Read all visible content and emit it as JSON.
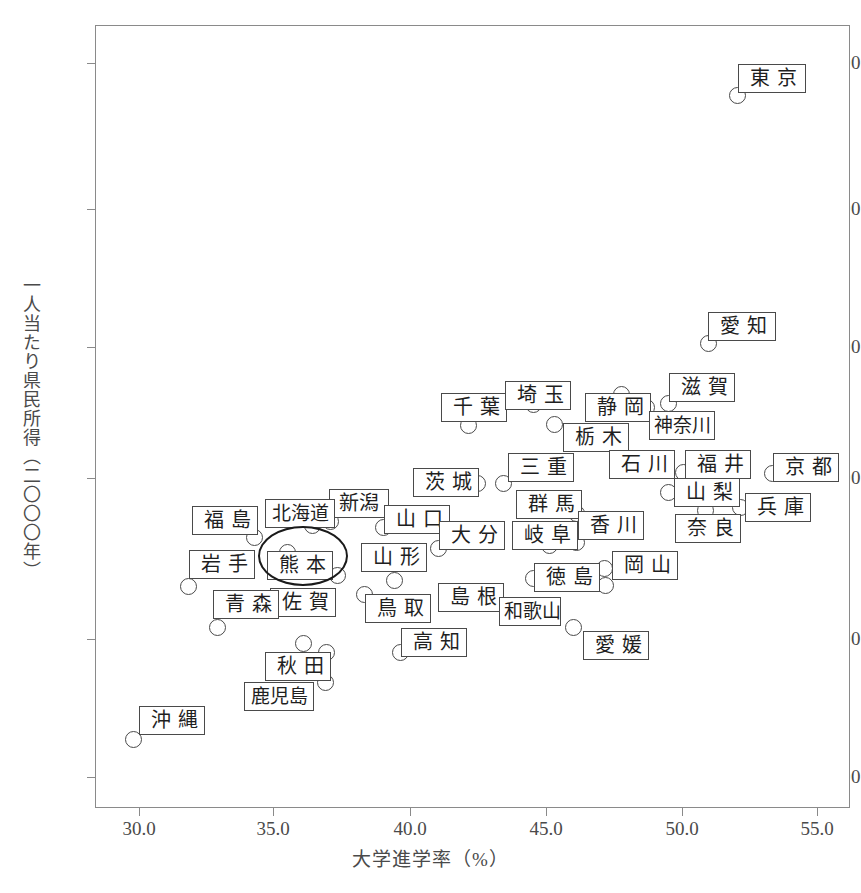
{
  "chart_data": {
    "type": "scatter",
    "title": "",
    "xlabel": "大学進学率（%）",
    "ylabel": "一人当たり県民所得（二〇〇〇年）",
    "xlim": [
      28.8,
      56.0
    ],
    "ylim": [
      1890,
      4610
    ],
    "xticks": [
      "30.0",
      "35.0",
      "40.0",
      "45.0",
      "50.0",
      "55.0"
    ],
    "xtick_values": [
      30.0,
      35.0,
      40.0,
      45.0,
      50.0,
      55.0
    ],
    "yticks": [
      "2000",
      "2500",
      "3000",
      "3500",
      "4000",
      "4500"
    ],
    "ytick_values": [
      2000,
      2500,
      3000,
      3500,
      4000,
      4500
    ],
    "grid": false,
    "legend": false,
    "highlight": {
      "label": "熊本",
      "shape": "ellipse"
    },
    "points": [
      {
        "label": "東京",
        "x": 51.9,
        "y": 4385
      },
      {
        "label": "愛知",
        "x": 50.8,
        "y": 3520
      },
      {
        "label": "滋賀",
        "x": 49.3,
        "y": 3290
      },
      {
        "label": "静岡",
        "x": 45.4,
        "y": 3325
      },
      {
        "label": "神奈川",
        "x": 49.2,
        "y": 3265
      },
      {
        "label": "埼玉",
        "x": 44.0,
        "y": 3285
      },
      {
        "label": "千葉",
        "x": 41.5,
        "y": 3225
      },
      {
        "label": "栃木",
        "x": 43.3,
        "y": 3230
      },
      {
        "label": "京都",
        "x": 53.0,
        "y": 3040
      },
      {
        "label": "福井",
        "x": 49.5,
        "y": 3040
      },
      {
        "label": "石川",
        "x": 47.2,
        "y": 3055
      },
      {
        "label": "三重",
        "x": 44.2,
        "y": 3040
      },
      {
        "label": "茨城",
        "x": 43.2,
        "y": 3040
      },
      {
        "label": "山梨",
        "x": 48.9,
        "y": 2970
      },
      {
        "label": "兵庫",
        "x": 53.4,
        "y": 2880
      },
      {
        "label": "奈良",
        "x": 51.5,
        "y": 2915
      },
      {
        "label": "群馬",
        "x": 44.6,
        "y": 2890
      },
      {
        "label": "香川",
        "x": 46.3,
        "y": 2790
      },
      {
        "label": "岐阜",
        "x": 45.4,
        "y": 2800
      },
      {
        "label": "新潟",
        "x": 36.4,
        "y": 2900
      },
      {
        "label": "北海道",
        "x": 34.7,
        "y": 2870
      },
      {
        "label": "福島",
        "x": 34.0,
        "y": 2810
      },
      {
        "label": "山口",
        "x": 38.6,
        "y": 2865
      },
      {
        "label": "大分",
        "x": 40.4,
        "y": 2780
      },
      {
        "label": "山形",
        "x": 38.9,
        "y": 2755
      },
      {
        "label": "熊本",
        "x": 35.5,
        "y": 2775
      },
      {
        "label": "岩手",
        "x": 31.9,
        "y": 2680
      },
      {
        "label": "佐賀",
        "x": 36.9,
        "y": 2700
      },
      {
        "label": "青森",
        "x": 32.8,
        "y": 2530
      },
      {
        "label": "岡山",
        "x": 47.0,
        "y": 2700
      },
      {
        "label": "徳島",
        "x": 46.0,
        "y": 2665
      },
      {
        "label": "島根",
        "x": 38.0,
        "y": 2680
      },
      {
        "label": "鳥取",
        "x": 37.4,
        "y": 2620
      },
      {
        "label": "和歌山",
        "x": 43.6,
        "y": 2590
      },
      {
        "label": "愛媛",
        "x": 46.1,
        "y": 2520
      },
      {
        "label": "高知",
        "x": 39.6,
        "y": 2480
      },
      {
        "label": "秋田",
        "x": 36.1,
        "y": 2465
      },
      {
        "label": "鹿児島",
        "x": 36.9,
        "y": 2430
      },
      {
        "label": "沖縄",
        "x": 30.3,
        "y": 2125
      }
    ]
  },
  "axes": {
    "x_title": "大学進学率（%）",
    "y_title": "一人当たり県民所得（二〇〇〇年）",
    "xticks": [
      {
        "text": "30.0",
        "px": 139
      },
      {
        "text": "35.0",
        "px": 273
      },
      {
        "text": "40.0",
        "px": 410
      },
      {
        "text": "45.0",
        "px": 546
      },
      {
        "text": "50.0",
        "px": 682
      },
      {
        "text": "55.0",
        "px": 817
      }
    ],
    "yticks": [
      {
        "text": "4500",
        "px": 63
      },
      {
        "text": "4000",
        "px": 209
      },
      {
        "text": "3500",
        "px": 347
      },
      {
        "text": "3000",
        "px": 478
      },
      {
        "text": "2500",
        "px": 639
      },
      {
        "text": "2000",
        "px": 777
      }
    ]
  },
  "markers": [
    {
      "name": "東京",
      "cx": 737,
      "cy": 95
    },
    {
      "name": "愛知",
      "cx": 708,
      "cy": 343
    },
    {
      "name": "滋賀",
      "cx": 668,
      "cy": 403
    },
    {
      "name": "静岡1",
      "cx": 621,
      "cy": 394
    },
    {
      "name": "静岡2",
      "cx": 646,
      "cy": 407
    },
    {
      "name": "埼玉",
      "cx": 533,
      "cy": 404
    },
    {
      "name": "千葉",
      "cx": 468,
      "cy": 425
    },
    {
      "name": "栃木",
      "cx": 554,
      "cy": 424
    },
    {
      "name": "京都",
      "cx": 772,
      "cy": 473
    },
    {
      "name": "福井",
      "cx": 683,
      "cy": 472
    },
    {
      "name": "石川",
      "cx": 650,
      "cy": 466
    },
    {
      "name": "三重",
      "cx": 503,
      "cy": 483
    },
    {
      "name": "茨城",
      "cx": 477,
      "cy": 483
    },
    {
      "name": "山梨",
      "cx": 668,
      "cy": 492
    },
    {
      "name": "兵庫",
      "cx": 740,
      "cy": 507
    },
    {
      "name": "奈良",
      "cx": 705,
      "cy": 510
    },
    {
      "name": "群馬",
      "cx": 576,
      "cy": 513
    },
    {
      "name": "香川",
      "cx": 576,
      "cy": 542
    },
    {
      "name": "岐阜",
      "cx": 549,
      "cy": 545
    },
    {
      "name": "新潟",
      "cx": 330,
      "cy": 521
    },
    {
      "name": "北海道",
      "cx": 312,
      "cy": 525
    },
    {
      "name": "福島",
      "cx": 254,
      "cy": 537
    },
    {
      "name": "山口",
      "cx": 383,
      "cy": 527
    },
    {
      "name": "大分",
      "cx": 438,
      "cy": 548
    },
    {
      "name": "山形",
      "cx": 392,
      "cy": 557
    },
    {
      "name": "熊本",
      "cx": 287,
      "cy": 552
    },
    {
      "name": "岩手",
      "cx": 188,
      "cy": 586
    },
    {
      "name": "佐賀",
      "cx": 337,
      "cy": 575
    },
    {
      "name": "青森",
      "cx": 217,
      "cy": 627
    },
    {
      "name": "岡山",
      "cx": 604,
      "cy": 568
    },
    {
      "name": "岡山2",
      "cx": 605,
      "cy": 585
    },
    {
      "name": "徳島",
      "cx": 533,
      "cy": 578
    },
    {
      "name": "島根",
      "cx": 394,
      "cy": 580
    },
    {
      "name": "鳥取",
      "cx": 364,
      "cy": 594
    },
    {
      "name": "和歌山",
      "cx": 529,
      "cy": 617
    },
    {
      "name": "愛媛",
      "cx": 573,
      "cy": 627
    },
    {
      "name": "高知",
      "cx": 400,
      "cy": 652
    },
    {
      "name": "秋田",
      "cx": 303,
      "cy": 643
    },
    {
      "name": "秋田2",
      "cx": 326,
      "cy": 652
    },
    {
      "name": "鹿児島",
      "cx": 325,
      "cy": 682
    },
    {
      "name": "沖縄",
      "cx": 133,
      "cy": 739
    }
  ],
  "labels": [
    {
      "text": "東京",
      "x": 738,
      "y": 64,
      "w": 68,
      "cls": "w2"
    },
    {
      "text": "愛知",
      "x": 708,
      "y": 312,
      "w": 68,
      "cls": "w2"
    },
    {
      "text": "滋賀",
      "x": 669,
      "y": 373,
      "w": 66,
      "cls": "w2"
    },
    {
      "text": "千葉",
      "x": 441,
      "y": 393,
      "w": 66,
      "cls": "w2"
    },
    {
      "text": "埼玉",
      "x": 505,
      "y": 381,
      "w": 66,
      "cls": "w2"
    },
    {
      "text": "静岡",
      "x": 585,
      "y": 393,
      "w": 66,
      "cls": "w2"
    },
    {
      "text": "神奈川",
      "x": 649,
      "y": 411,
      "w": 66,
      "cls": "w3"
    },
    {
      "text": "栃木",
      "x": 563,
      "y": 423,
      "w": 66,
      "cls": "w2"
    },
    {
      "text": "京都",
      "x": 773,
      "y": 453,
      "w": 66,
      "cls": "w2"
    },
    {
      "text": "福井",
      "x": 685,
      "y": 450,
      "w": 66,
      "cls": "w2"
    },
    {
      "text": "石川",
      "x": 609,
      "y": 450,
      "w": 66,
      "cls": "w2"
    },
    {
      "text": "三重",
      "x": 508,
      "y": 453,
      "w": 66,
      "cls": "w2"
    },
    {
      "text": "茨城",
      "x": 413,
      "y": 468,
      "w": 66,
      "cls": "w2"
    },
    {
      "text": "山梨",
      "x": 674,
      "y": 478,
      "w": 66,
      "cls": "w2"
    },
    {
      "text": "兵庫",
      "x": 745,
      "y": 493,
      "w": 66,
      "cls": "w2"
    },
    {
      "text": "奈良",
      "x": 675,
      "y": 514,
      "w": 66,
      "cls": "w2"
    },
    {
      "text": "群馬",
      "x": 516,
      "y": 490,
      "w": 66,
      "cls": "w2"
    },
    {
      "text": "香川",
      "x": 578,
      "y": 511,
      "w": 66,
      "cls": "w2"
    },
    {
      "text": "岐阜",
      "x": 512,
      "y": 521,
      "w": 66,
      "cls": "w2"
    },
    {
      "text": "新潟",
      "x": 329,
      "y": 489,
      "w": 60,
      "cls": "narrow"
    },
    {
      "text": "北海道",
      "x": 265,
      "y": 499,
      "w": 70,
      "cls": "w3"
    },
    {
      "text": "福島",
      "x": 192,
      "y": 506,
      "w": 66,
      "cls": "w2"
    },
    {
      "text": "山口",
      "x": 384,
      "y": 505,
      "w": 66,
      "cls": "w2"
    },
    {
      "text": "大分",
      "x": 439,
      "y": 521,
      "w": 66,
      "cls": "w2"
    },
    {
      "text": "山形",
      "x": 361,
      "y": 543,
      "w": 66,
      "cls": "w2"
    },
    {
      "text": "岩手",
      "x": 189,
      "y": 550,
      "w": 66,
      "cls": "w2"
    },
    {
      "text": "熊本",
      "x": 267,
      "y": 551,
      "w": 66,
      "cls": "w2"
    },
    {
      "text": "佐賀",
      "x": 270,
      "y": 588,
      "w": 66,
      "cls": "w2"
    },
    {
      "text": "青森",
      "x": 213,
      "y": 590,
      "w": 66,
      "cls": "w2"
    },
    {
      "text": "岡山",
      "x": 612,
      "y": 551,
      "w": 66,
      "cls": "w2"
    },
    {
      "text": "徳島",
      "x": 534,
      "y": 563,
      "w": 66,
      "cls": "w2"
    },
    {
      "text": "島根",
      "x": 438,
      "y": 583,
      "w": 66,
      "cls": "w2"
    },
    {
      "text": "鳥取",
      "x": 365,
      "y": 594,
      "w": 66,
      "cls": "w2"
    },
    {
      "text": "和歌山",
      "x": 499,
      "y": 597,
      "w": 62,
      "cls": "w3"
    },
    {
      "text": "愛媛",
      "x": 583,
      "y": 631,
      "w": 66,
      "cls": "w2"
    },
    {
      "text": "高知",
      "x": 401,
      "y": 628,
      "w": 66,
      "cls": "w2"
    },
    {
      "text": "秋田",
      "x": 265,
      "y": 652,
      "w": 66,
      "cls": "w2"
    },
    {
      "text": "鹿児島",
      "x": 244,
      "y": 682,
      "w": 70,
      "cls": "w3"
    },
    {
      "text": "沖縄",
      "x": 139,
      "y": 706,
      "w": 66,
      "cls": "w2"
    }
  ],
  "highlight_ellipse": {
    "left": 258,
    "top": 526,
    "width": 86,
    "height": 56
  }
}
